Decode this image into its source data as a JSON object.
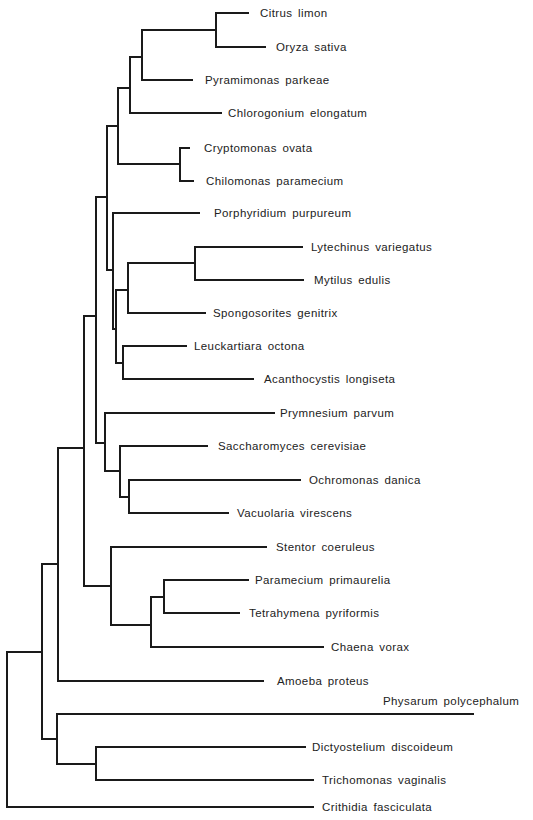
{
  "figure": {
    "type": "phylogenetic-tree",
    "orientation": "rooted, root at left",
    "line_color": "#1a1a1a",
    "label_color": "#222222"
  },
  "taxa": [
    {
      "name": "Citrus  limon",
      "y": 13,
      "x0": 216,
      "x1": 248,
      "lx": 260
    },
    {
      "name": "Oryza sativa",
      "y": 47,
      "x0": 216,
      "x1": 265,
      "lx": 276
    },
    {
      "name": "Pyramimonas parkeae",
      "y": 80,
      "x0": 142,
      "x1": 192,
      "lx": 205
    },
    {
      "name": "Chlorogonium elongatum",
      "y": 113,
      "x0": 130,
      "x1": 221,
      "lx": 228
    },
    {
      "name": "Cryptomonas ovata",
      "y": 148,
      "x0": 180,
      "x1": 189,
      "lx": 204
    },
    {
      "name": "Chilomonas paramecium",
      "y": 181,
      "x0": 180,
      "x1": 193,
      "lx": 206
    },
    {
      "name": "Porphyridium  purpureum",
      "y": 213,
      "x0": 113,
      "x1": 199,
      "lx": 214
    },
    {
      "name": "Lytechinus  variegatus",
      "y": 247,
      "x0": 195,
      "x1": 302,
      "lx": 311
    },
    {
      "name": "Mytilus  edulis",
      "y": 280,
      "x0": 195,
      "x1": 303,
      "lx": 314
    },
    {
      "name": "Spongosorites  genitrix",
      "y": 313,
      "x0": 128,
      "x1": 205,
      "lx": 213
    },
    {
      "name": "Leuckartiara octona",
      "y": 346,
      "x0": 123,
      "x1": 186,
      "lx": 194
    },
    {
      "name": "Acanthocystis longiseta",
      "y": 379,
      "x0": 123,
      "x1": 253,
      "lx": 264
    },
    {
      "name": "Prymnesium  parvum",
      "y": 413,
      "x0": 105,
      "x1": 274,
      "lx": 280
    },
    {
      "name": "Saccharomyces cerevisiae",
      "y": 446,
      "x0": 120,
      "x1": 207,
      "lx": 218
    },
    {
      "name": "Ochromonas danica",
      "y": 480,
      "x0": 129,
      "x1": 300,
      "lx": 309
    },
    {
      "name": "Vacuolaria virescens",
      "y": 513,
      "x0": 129,
      "x1": 228,
      "lx": 237
    },
    {
      "name": "Stentor  coeruleus",
      "y": 547,
      "x0": 111,
      "x1": 266,
      "lx": 276
    },
    {
      "name": "Paramecium  primaurelia",
      "y": 580,
      "x0": 164,
      "x1": 248,
      "lx": 255
    },
    {
      "name": "Tetrahymena  pyriformis",
      "y": 613,
      "x0": 164,
      "x1": 239,
      "lx": 249
    },
    {
      "name": "Chaena vorax",
      "y": 647,
      "x0": 151,
      "x1": 323,
      "lx": 331
    },
    {
      "name": "Amoeba proteus",
      "y": 681,
      "x0": 59,
      "x1": 263,
      "lx": 277
    },
    {
      "name": "Physarum  polycephalum",
      "y": 714,
      "x0": 57,
      "x1": 473,
      "lx": 383,
      "ly": 701
    },
    {
      "name": "Dictyostelium  discoideum",
      "y": 747,
      "x0": 96,
      "x1": 305,
      "lx": 312
    },
    {
      "name": "Trichomonas  vaginalis",
      "y": 780,
      "x0": 96,
      "x1": 313,
      "lx": 322
    },
    {
      "name": "Crithidia  fasciculata",
      "y": 807,
      "x0": 8,
      "x1": 313,
      "lx": 322
    }
  ],
  "internal_nodes": [
    {
      "id": "citrus-oryza",
      "x": 216,
      "y0": 13,
      "y1": 47,
      "mid": 30,
      "parent_x": 142
    },
    {
      "id": "angiosperm-pyramimonas",
      "x": 142,
      "y0": 30,
      "y1": 80,
      "mid": 57,
      "parent_x": 130
    },
    {
      "id": "green-plants",
      "x": 130,
      "y0": 57,
      "y1": 113,
      "mid": 88,
      "parent_x": 118
    },
    {
      "id": "cryptomonads",
      "x": 180,
      "y0": 148,
      "y1": 181,
      "mid": 164,
      "parent_x": 118
    },
    {
      "id": "plants-cryptomonads",
      "x": 118,
      "y0": 88,
      "y1": 164,
      "mid": 126,
      "parent_x": 107
    },
    {
      "id": "lytechinus-mytilus",
      "x": 195,
      "y0": 247,
      "y1": 280,
      "mid": 263,
      "parent_x": 128
    },
    {
      "id": "animals-sponge",
      "x": 128,
      "y0": 263,
      "y1": 313,
      "mid": 290,
      "parent_x": 116
    },
    {
      "id": "leuckartiara-acanthocystis",
      "x": 123,
      "y0": 346,
      "y1": 379,
      "mid": 363,
      "parent_x": 116
    },
    {
      "id": "animals-group",
      "x": 116,
      "y0": 290,
      "y1": 363,
      "mid": 329,
      "parent_x": 113
    },
    {
      "id": "porphyridium-animals",
      "x": 113,
      "y0": 213,
      "y1": 329,
      "mid": 270,
      "parent_x": 107
    },
    {
      "id": "upper-crown",
      "x": 107,
      "y0": 126,
      "y1": 270,
      "mid": 197,
      "parent_x": 96
    },
    {
      "id": "ochromonas-vacuolaria",
      "x": 129,
      "y0": 480,
      "y1": 513,
      "mid": 497,
      "parent_x": 120
    },
    {
      "id": "saccharomyces-chromophytes",
      "x": 120,
      "y0": 446,
      "y1": 497,
      "mid": 471,
      "parent_x": 105
    },
    {
      "id": "prymnesium-group",
      "x": 105,
      "y0": 413,
      "y1": 471,
      "mid": 443,
      "parent_x": 96
    },
    {
      "id": "crown",
      "x": 96,
      "y0": 197,
      "y1": 443,
      "mid": 316,
      "parent_x": 84
    },
    {
      "id": "paramecium-tetrahymena",
      "x": 164,
      "y0": 580,
      "y1": 613,
      "mid": 597,
      "parent_x": 151
    },
    {
      "id": "ciliates-inner",
      "x": 151,
      "y0": 597,
      "y1": 647,
      "mid": 625,
      "parent_x": 111
    },
    {
      "id": "ciliates",
      "x": 111,
      "y0": 547,
      "y1": 625,
      "mid": 586,
      "parent_x": 84
    },
    {
      "id": "crown-ciliates",
      "x": 84,
      "y0": 316,
      "y1": 586,
      "mid": 448,
      "parent_x": 58
    },
    {
      "id": "amoeba-crown",
      "x": 58,
      "y0": 448,
      "y1": 681,
      "mid": 564,
      "parent_x": 42
    },
    {
      "id": "dictyostelium-trichomonas",
      "x": 96,
      "y0": 747,
      "y1": 780,
      "mid": 764,
      "parent_x": 57
    },
    {
      "id": "physarum-group",
      "x": 57,
      "y0": 714,
      "y1": 764,
      "mid": 739,
      "parent_x": 42
    },
    {
      "id": "eukaryote-core",
      "x": 42,
      "y0": 564,
      "y1": 739,
      "mid": 652,
      "parent_x": 7
    },
    {
      "id": "root",
      "x": 7,
      "y0": 652,
      "y1": 807,
      "mid": 730,
      "parent_x": null
    }
  ]
}
